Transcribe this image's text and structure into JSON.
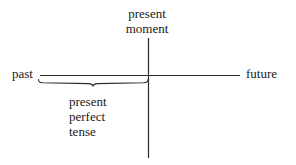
{
  "diagram": {
    "type": "timeline-axis",
    "background_color": "#ffffff",
    "stroke_color": "#2b2b2b",
    "text_color": "#1a1a1a",
    "labels": {
      "present_moment": {
        "line1": "present",
        "line2": "moment"
      },
      "past": "past",
      "future": "future",
      "present_perfect_tense": {
        "line1": "present",
        "line2": "perfect",
        "line3": "tense"
      }
    },
    "geometry": {
      "horizontal_axis": {
        "x1": 40,
        "y": 75,
        "x2": 240
      },
      "vertical_axis": {
        "x": 148,
        "y1": 38,
        "y2": 158
      },
      "brace": {
        "x1": 38,
        "x2": 148,
        "y": 81,
        "center_x": 93
      }
    }
  }
}
